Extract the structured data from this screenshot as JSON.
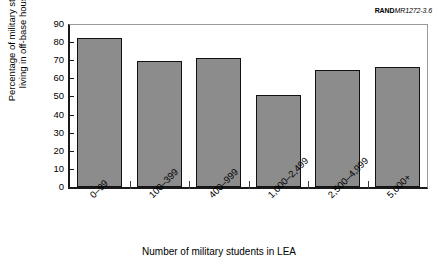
{
  "figure_id": {
    "mark": "RAND",
    "number": "MR1272-3.6"
  },
  "chart_data": {
    "type": "bar",
    "title": "",
    "categories": [
      "0–99",
      "100–399",
      "400–999",
      "1,000–2,499",
      "2,500–4,999",
      "5,000+"
    ],
    "values": [
      82.3,
      69.8,
      71.4,
      50.6,
      64.6,
      66.2
    ],
    "xlabel": "Number of military students in LEA",
    "ylabel_line1": "Percentage of military students",
    "ylabel_line2": "living in off-base housing",
    "ylim": [
      0,
      90
    ],
    "ytick_values": [
      0,
      10,
      20,
      30,
      40,
      50,
      60,
      70,
      80,
      90
    ],
    "ytick_labels": [
      "0",
      "10",
      "20",
      "30",
      "40",
      "50",
      "60",
      "70",
      "80",
      "90"
    ],
    "grid": false,
    "legend": "none",
    "bar_color": "#8c8c8c",
    "bar_edge_color": "#121212"
  }
}
